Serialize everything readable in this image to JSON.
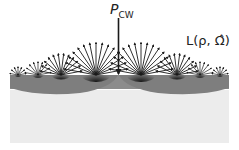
{
  "labels": {
    "incident_power": "P",
    "incident_power_sub": "CW",
    "radiance": "L(ρ, Ω̂)"
  },
  "colors": {
    "background": "#ffffff",
    "surface_band": "#8c8c8c",
    "surface_lobe": "#7a7a7a",
    "medium": "#ececec",
    "arrows": "#1a1a1a"
  },
  "geometry": {
    "center_x": 118.5,
    "surface_y": 75,
    "fans": [
      {
        "x": 18,
        "r": 8,
        "n": 7
      },
      {
        "x": 38,
        "r": 13,
        "n": 9
      },
      {
        "x": 61,
        "r": 21,
        "n": 12
      },
      {
        "x": 96,
        "r": 32,
        "n": 15
      },
      {
        "x": 141,
        "r": 32,
        "n": 15
      },
      {
        "x": 177,
        "r": 21,
        "n": 12
      },
      {
        "x": 200,
        "r": 13,
        "n": 9
      },
      {
        "x": 220,
        "r": 8,
        "n": 7
      }
    ]
  }
}
